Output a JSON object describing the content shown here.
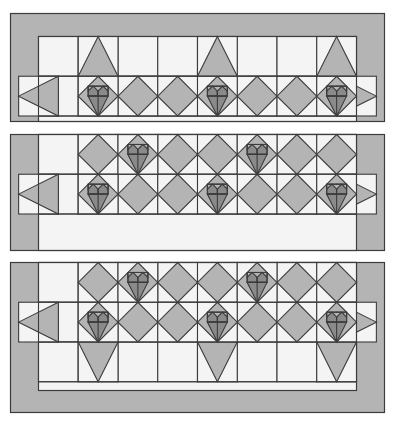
{
  "document": {
    "title": "Heart Quilt Block Layout Diagram",
    "canvas_width": 398,
    "canvas_height": 426,
    "background_color": "#ffffff"
  },
  "palette": {
    "background": "#ffffff",
    "light_fabric": "#f4f4f4",
    "medium_gray_fabric": "#b4b4b4",
    "dark_gray_fabric": "#8a8a8a",
    "outline": "#3c3c3c",
    "outline_width": 1.1,
    "border_fabric": "#b4b4b4"
  },
  "chart_data": {
    "type": "diagram",
    "title": "Heart Quilt Block Layout Diagram",
    "grid_unit_px": 38.2,
    "panels": [
      {
        "id": "panel-top",
        "label": "Top row panel",
        "x": 10.5,
        "y": 13.5,
        "width": 374,
        "height": 108,
        "border_left": 28,
        "border_right": 28,
        "border_top": 23,
        "border_bottom": 0,
        "columns": 8,
        "rows": 2,
        "heart_positions": [
          {
            "row": 1,
            "col": 1
          },
          {
            "row": 1,
            "col": 4
          },
          {
            "row": 1,
            "col": 7
          }
        ],
        "setting_positions": [
          {
            "row": 1,
            "col": 0,
            "kind": "half-left"
          },
          {
            "row": 1,
            "col": 2,
            "kind": "hourglass"
          },
          {
            "row": 1,
            "col": 3,
            "kind": "hourglass"
          },
          {
            "row": 1,
            "col": 5,
            "kind": "hourglass"
          },
          {
            "row": 1,
            "col": 6,
            "kind": "hourglass"
          },
          {
            "row": 1,
            "col": 8,
            "kind": "half-right"
          }
        ],
        "peak_positions": [
          {
            "row": 0,
            "col": 1
          },
          {
            "row": 0,
            "col": 4
          },
          {
            "row": 0,
            "col": 7
          }
        ]
      },
      {
        "id": "panel-middle",
        "label": "Middle row panel",
        "x": 10.5,
        "y": 134.5,
        "width": 374,
        "height": 116,
        "border_left": 28,
        "border_right": 28,
        "border_top": 0,
        "border_bottom": 0,
        "columns": 8,
        "rows": 2,
        "heart_positions": [
          {
            "row": 0,
            "col": 2
          },
          {
            "row": 0,
            "col": 5
          },
          {
            "row": 1,
            "col": 1
          },
          {
            "row": 1,
            "col": 4
          },
          {
            "row": 1,
            "col": 7
          }
        ],
        "setting_positions": [
          {
            "row": 0,
            "col": 1,
            "kind": "hourglass"
          },
          {
            "row": 0,
            "col": 3,
            "kind": "hourglass"
          },
          {
            "row": 0,
            "col": 4,
            "kind": "hourglass"
          },
          {
            "row": 0,
            "col": 6,
            "kind": "hourglass"
          },
          {
            "row": 0,
            "col": 7,
            "kind": "hourglass"
          },
          {
            "row": 1,
            "col": 0,
            "kind": "half-left"
          },
          {
            "row": 1,
            "col": 2,
            "kind": "hourglass"
          },
          {
            "row": 1,
            "col": 3,
            "kind": "hourglass"
          },
          {
            "row": 1,
            "col": 5,
            "kind": "hourglass"
          },
          {
            "row": 1,
            "col": 6,
            "kind": "hourglass"
          },
          {
            "row": 1,
            "col": 8,
            "kind": "half-right"
          }
        ]
      },
      {
        "id": "panel-bottom",
        "label": "Bottom row panel",
        "x": 10.5,
        "y": 262.5,
        "width": 374,
        "height": 150,
        "border_left": 28,
        "border_right": 28,
        "border_top": 0,
        "border_bottom": 22,
        "columns": 8,
        "rows": 3,
        "heart_positions": [
          {
            "row": 0,
            "col": 2
          },
          {
            "row": 0,
            "col": 5
          },
          {
            "row": 1,
            "col": 1
          },
          {
            "row": 1,
            "col": 4
          },
          {
            "row": 1,
            "col": 7
          }
        ],
        "setting_positions": [
          {
            "row": 0,
            "col": 1,
            "kind": "hourglass"
          },
          {
            "row": 0,
            "col": 3,
            "kind": "hourglass"
          },
          {
            "row": 0,
            "col": 4,
            "kind": "hourglass"
          },
          {
            "row": 0,
            "col": 6,
            "kind": "hourglass"
          },
          {
            "row": 0,
            "col": 7,
            "kind": "hourglass"
          },
          {
            "row": 1,
            "col": 0,
            "kind": "half-left"
          },
          {
            "row": 1,
            "col": 2,
            "kind": "hourglass"
          },
          {
            "row": 1,
            "col": 3,
            "kind": "hourglass"
          },
          {
            "row": 1,
            "col": 5,
            "kind": "hourglass"
          },
          {
            "row": 1,
            "col": 6,
            "kind": "hourglass"
          },
          {
            "row": 1,
            "col": 8,
            "kind": "half-right"
          }
        ],
        "trough_positions": [
          {
            "row": 2,
            "col": 1
          },
          {
            "row": 2,
            "col": 4
          },
          {
            "row": 2,
            "col": 7
          }
        ]
      }
    ],
    "legend": [
      {
        "name": "Dark gray heart fabric",
        "color": "#8a8a8a"
      },
      {
        "name": "Medium gray setting fabric",
        "color": "#b4b4b4"
      },
      {
        "name": "Light background fabric",
        "color": "#f4f4f4"
      }
    ]
  }
}
